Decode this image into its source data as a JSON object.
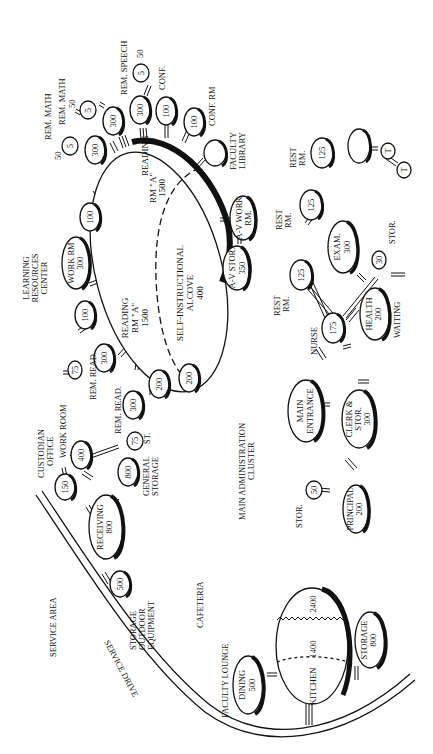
{
  "diagram": {
    "type": "bubble-adjacency-diagram",
    "orientation": "rotated-90-ccw",
    "clusters": [
      {
        "name": "LEARNING RESOURCES CENTER",
        "lines": [
          "LEARNING",
          "RESOURCES",
          "CENTER"
        ]
      },
      {
        "name": "MAIN ADMINISTRATION CLUSTER",
        "lines": [
          "MAIN ADMINISTRATION",
          "CLUSTER"
        ]
      },
      {
        "name": "SERVICE AREA",
        "lines": [
          "SERVICE AREA"
        ]
      },
      {
        "name": "CAFETERIA",
        "lines": [
          "CAFETERIA"
        ]
      }
    ],
    "road": {
      "label": "SERVICE DRIVE"
    },
    "lrc": {
      "reading_a_top": [
        "READING",
        "RM \"A\"",
        "1500"
      ],
      "reading_a_main": [
        "READING",
        "RM \"A\"",
        "1500"
      ],
      "alcove": [
        "SELF-INSTRUCTIONAL",
        "ALCOVE",
        "400"
      ],
      "work_rm": [
        "WORK RM",
        "300"
      ],
      "av_work": [
        "A-V WORK",
        "RM."
      ],
      "av_stor": [
        "A-V STOR.",
        "350"
      ],
      "faculty_library": [
        "FACULTY",
        "LIBRARY"
      ],
      "conf_rm_label": "CONF. RM",
      "conf_label": "CONF.",
      "rem_speech_label": "REM. SPEECH",
      "rem_math_1": "REM. MATH",
      "rem_math_2": "REM. MATH",
      "rem_read_1": "REM. READ.",
      "rem_read_2": "REM. READ.",
      "st_label": "ST.",
      "nodes": {
        "n100a": "100",
        "n100b": "100",
        "n100c": "100",
        "n100d": "100",
        "n300a": "300",
        "n300b": "300",
        "n300c": "300",
        "n5a": "5",
        "n5b": "5",
        "n5c": "5",
        "n50a": "50",
        "n50b": "50",
        "n50c": "50",
        "n75a": "75",
        "n75b": "75",
        "n300r1": "300",
        "n300r2": "300",
        "n200a": "200",
        "n200b": "200"
      }
    },
    "admin": {
      "main_entrance": [
        "MAIN",
        "ENTRANCE"
      ],
      "clerk": [
        "CLERK &",
        "STOR.",
        "300"
      ],
      "principal": [
        "PRINCIPAL",
        "200"
      ],
      "principal_stor": {
        "label": "STOR.",
        "value": "50"
      },
      "nurse": {
        "label": "NURSE",
        "value": "175"
      },
      "health": [
        "HEALTH",
        "200"
      ],
      "waiting": "WAITING",
      "exam": [
        "EXAM.",
        "300"
      ],
      "exam_stor": {
        "label": "STOR.",
        "value": "30"
      },
      "rest_1": {
        "label": [
          "REST",
          "RM."
        ],
        "value": "125"
      },
      "rest_2": {
        "label": [
          "REST",
          "RM."
        ],
        "value": "125"
      },
      "rest_3": {
        "label": [
          "REST",
          "RM."
        ],
        "value": "125"
      },
      "toilet_1": "T",
      "toilet_2": "T"
    },
    "service": {
      "custodian": {
        "label": [
          "CUSTODIAN",
          "OFFICE"
        ],
        "value": "150"
      },
      "work_room": {
        "label": "WORK ROOM",
        "value": "400"
      },
      "receiving": [
        "RECEIVING",
        "800"
      ],
      "general_storage": {
        "label": [
          "GENERAL",
          "STORAGE"
        ],
        "value": "800"
      },
      "outdoor_storage": {
        "label": [
          "STORAGE",
          "OUTDOOR",
          "EQUIPMENT"
        ],
        "value": "500"
      }
    },
    "cafeteria": {
      "faculty_lounge": "FACULTY LOUNGE",
      "dining": [
        "DINING",
        "500"
      ],
      "kitchen": "KITCHEN",
      "kitchen_1400": "1400",
      "kitchen_2400": "2400",
      "storage": [
        "STORAGE",
        "800"
      ]
    }
  }
}
